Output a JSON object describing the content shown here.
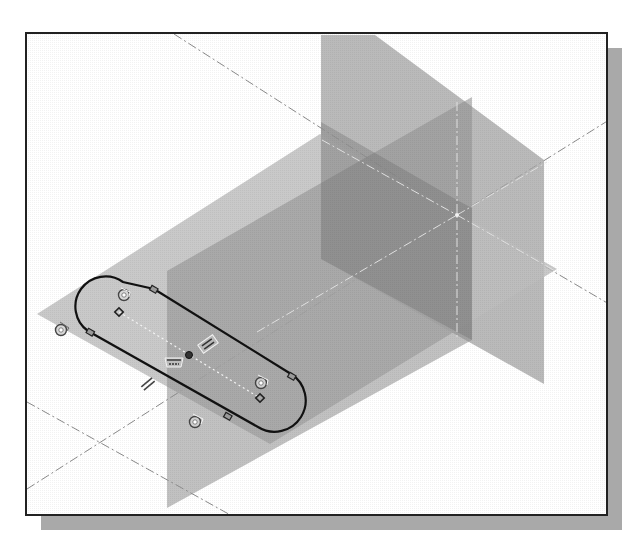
{
  "view": {
    "type": "3d-sketch-viewport",
    "description": "Isometric view of three datum planes with a slot sketch on the horizontal plane",
    "background_color": "#ffffff",
    "frame_color": "#222222",
    "shadow_color": "#a9a9a9"
  },
  "planes": [
    {
      "name": "horizontal-plane",
      "fill": "#bcbcbc",
      "opacity": 0.75
    },
    {
      "name": "back-vertical-plane",
      "fill": "#a8a8a8",
      "opacity": 0.7
    },
    {
      "name": "side-vertical-plane",
      "fill": "#9a9a9a",
      "opacity": 0.6
    }
  ],
  "sketch": {
    "profile": "slot",
    "line_color": "#111111",
    "constraints": [
      {
        "type": "tangent",
        "icon": "tangent-icon"
      },
      {
        "type": "tangent",
        "icon": "tangent-icon"
      },
      {
        "type": "tangent",
        "icon": "tangent-icon"
      },
      {
        "type": "tangent",
        "icon": "tangent-icon"
      },
      {
        "type": "parallel",
        "icon": "parallel-icon"
      },
      {
        "type": "parallel",
        "icon": "parallel-icon"
      },
      {
        "type": "horizontal",
        "icon": "horizontal-icon"
      }
    ]
  },
  "labels": {
    "accessible_title": "Slot sketch on datum plane with constraint glyphs"
  }
}
